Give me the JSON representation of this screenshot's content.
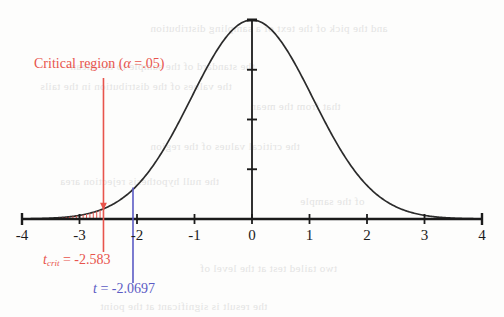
{
  "chart_data": {
    "type": "line",
    "title": "",
    "subtitle": "",
    "xlabel": "",
    "ylabel": "",
    "distribution": "t-distribution (bell curve)",
    "xlim": [
      -4,
      4
    ],
    "ylim": [
      0,
      1
    ],
    "grid": false,
    "legend_position": "none",
    "x_ticks": [
      -4,
      -3,
      -2,
      -1,
      0,
      1,
      2,
      3,
      4
    ],
    "x_tick_labels": [
      "-4",
      "-3",
      "-2",
      "-1",
      "0",
      "1",
      "2",
      "3",
      "4"
    ],
    "y_axis_ticks": 3,
    "peak": {
      "x": 0,
      "y": 1
    },
    "curve_sigma": 1.06,
    "series": [
      {
        "name": "t distribution density",
        "x": [
          -4,
          -3.8,
          -3.6,
          -3.4,
          -3.2,
          -3,
          -2.8,
          -2.6,
          -2.4,
          -2.2,
          -2,
          -1.8,
          -1.6,
          -1.4,
          -1.2,
          -1,
          -0.8,
          -0.6,
          -0.4,
          -0.2,
          0,
          0.2,
          0.4,
          0.6,
          0.8,
          1,
          1.2,
          1.4,
          1.6,
          1.8,
          2,
          2.2,
          2.4,
          2.6,
          2.8,
          3,
          3.2,
          3.4,
          3.6,
          3.8,
          4
        ],
        "values": [
          0.012,
          0.018,
          0.027,
          0.04,
          0.058,
          0.082,
          0.114,
          0.155,
          0.204,
          0.263,
          0.329,
          0.401,
          0.476,
          0.552,
          0.625,
          0.692,
          0.771,
          0.832,
          0.879,
          0.95,
          1.0,
          0.95,
          0.879,
          0.832,
          0.771,
          0.692,
          0.625,
          0.552,
          0.476,
          0.401,
          0.329,
          0.263,
          0.204,
          0.155,
          0.114,
          0.082,
          0.058,
          0.04,
          0.027,
          0.018,
          0.012
        ]
      }
    ],
    "shaded_regions": [
      {
        "name": "critical-region",
        "from": -4,
        "to": -2.583,
        "style": "vertical-hatch",
        "color": "#e8544c"
      }
    ],
    "markers": [
      {
        "name": "t-critical",
        "x": -2.583,
        "color": "#e8544c",
        "label": "t_crit = -2.583"
      },
      {
        "name": "t-observed",
        "x": -2.0697,
        "color": "#5b5bc4",
        "label": "t = -2.0697"
      }
    ]
  },
  "annotations": {
    "critical_region": {
      "text_before": "Critical region (",
      "alpha_symbol": "α",
      "text_after": " =.05)",
      "color": "#e8544c"
    },
    "t_crit": {
      "symbol": "t",
      "subscript": "crit",
      "value": " = -2.583",
      "color": "#e8544c"
    },
    "t_observed": {
      "symbol": "t",
      "value": " = -2.0697",
      "color": "#5b5bc4"
    }
  },
  "colors": {
    "curve": "#2b2b2b",
    "axis": "#1b1b1b",
    "critical": "#e8544c",
    "observed": "#5b5bc4",
    "background": "#fdfdfc"
  },
  "background_artifacts": [
    {
      "text": "and the pick of the text of a sampling distribution",
      "x": 150,
      "y": 22
    },
    {
      "text": "the standard of the sample to the mean",
      "x": 70,
      "y": 60
    },
    {
      "text": "the values of the distribution in the tails",
      "x": 40,
      "y": 80
    },
    {
      "text": "that from the mean",
      "x": 250,
      "y": 100
    },
    {
      "text": "the critical values of the region",
      "x": 150,
      "y": 140
    },
    {
      "text": "the null hypothesis rejection area",
      "x": 60,
      "y": 175
    },
    {
      "text": "of the sample",
      "x": 300,
      "y": 195
    },
    {
      "text": "two tailed test at the level of",
      "x": 200,
      "y": 262
    },
    {
      "text": "the result is significant at the point",
      "x": 100,
      "y": 300
    }
  ]
}
